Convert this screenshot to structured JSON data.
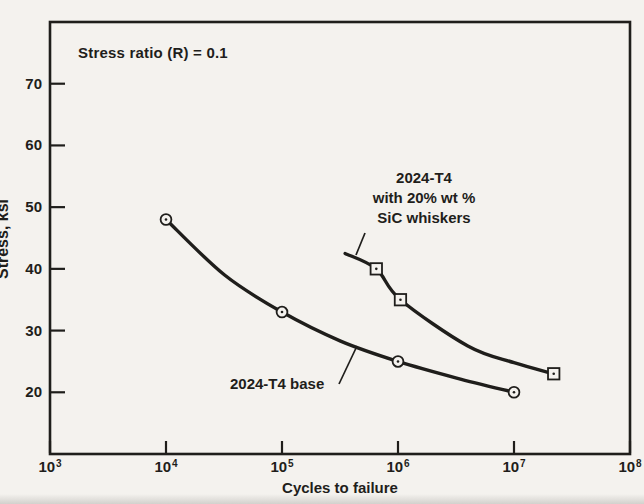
{
  "colors": {
    "ink": "#1f1e1b",
    "paper": "#f4f2ee"
  },
  "chart_data": {
    "type": "line",
    "title": "",
    "xlabel": "Cycles to failure",
    "ylabel": "Stress, ksi",
    "annotation": "Stress ratio (R) = 0.1",
    "x_scale": "log",
    "x_range_log10": [
      3,
      8
    ],
    "y_range": [
      10,
      80
    ],
    "grid": false,
    "legend_position": "inline-labels",
    "x_ticks": [
      {
        "base": "10",
        "exp": "3"
      },
      {
        "base": "10",
        "exp": "4"
      },
      {
        "base": "10",
        "exp": "5"
      },
      {
        "base": "10",
        "exp": "6"
      },
      {
        "base": "10",
        "exp": "7"
      },
      {
        "base": "10",
        "exp": "8"
      }
    ],
    "y_ticks": [
      20,
      30,
      40,
      50,
      60,
      70
    ],
    "series": [
      {
        "name": "2024-T4 base",
        "marker": "circle-dot",
        "label_lines": [
          "2024-T4 base"
        ],
        "points": [
          {
            "cycles": 10000,
            "stress": 48
          },
          {
            "cycles": 100000,
            "stress": 33
          },
          {
            "cycles": 1000000,
            "stress": 25
          },
          {
            "cycles": 10000000,
            "stress": 20
          }
        ],
        "curve": [
          {
            "cycles": 10000,
            "stress": 48
          },
          {
            "cycles": 32000,
            "stress": 39
          },
          {
            "cycles": 100000,
            "stress": 33
          },
          {
            "cycles": 320000,
            "stress": 28.3
          },
          {
            "cycles": 1000000,
            "stress": 25
          },
          {
            "cycles": 3200000,
            "stress": 22.3
          },
          {
            "cycles": 10000000,
            "stress": 20
          }
        ]
      },
      {
        "name": "2024-T4 with 20% wt % SiC whiskers",
        "marker": "square-dot",
        "label_lines": [
          "2024-T4",
          "with 20% wt %",
          "SiC whiskers"
        ],
        "points": [
          {
            "cycles": 650000,
            "stress": 40
          },
          {
            "cycles": 1050000,
            "stress": 35
          },
          {
            "cycles": 22000000,
            "stress": 23
          }
        ],
        "curve": [
          {
            "cycles": 350000,
            "stress": 42.5
          },
          {
            "cycles": 650000,
            "stress": 40
          },
          {
            "cycles": 1050000,
            "stress": 35
          },
          {
            "cycles": 4000000,
            "stress": 27.5
          },
          {
            "cycles": 10000000,
            "stress": 24.8
          },
          {
            "cycles": 22000000,
            "stress": 23
          }
        ]
      }
    ]
  }
}
